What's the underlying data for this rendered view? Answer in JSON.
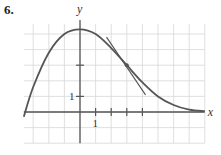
{
  "problem": {
    "number": "6."
  },
  "chart_data": {
    "type": "line",
    "title": "",
    "xlabel": "x",
    "ylabel": "y",
    "xlim": [
      -4,
      8
    ],
    "ylim": [
      -2,
      6
    ],
    "grid": true,
    "tick_labels": {
      "x": [
        "1"
      ],
      "y": [
        "1"
      ]
    },
    "x_ticks": [
      1,
      2,
      3,
      4
    ],
    "y_ticks": [
      1,
      3
    ],
    "series": [
      {
        "name": "f(x)",
        "x": [
          -3.6,
          -3,
          -2,
          -1,
          0,
          1,
          2,
          3,
          4,
          5,
          6,
          7,
          8
        ],
        "y": [
          -0.3,
          1.6,
          3.8,
          5.0,
          5.3,
          5.0,
          4.1,
          3.0,
          1.9,
          1.0,
          0.45,
          0.15,
          0.05
        ]
      },
      {
        "name": "tangent line at (3, 3)",
        "x": [
          1.7,
          4.2
        ],
        "y": [
          4.8,
          1.1
        ]
      }
    ],
    "annotations": [
      {
        "type": "point",
        "x": 3,
        "y": 3,
        "label": "point of tangency"
      }
    ]
  }
}
